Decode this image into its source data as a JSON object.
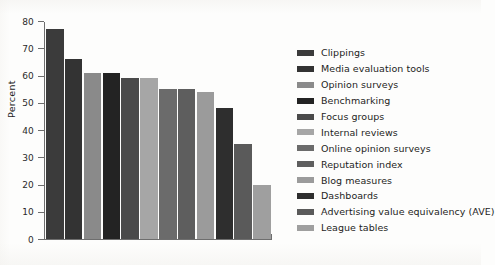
{
  "chart_data": {
    "type": "bar",
    "title": "",
    "subtitle": "",
    "xlabel": "",
    "ylabel": "Percent",
    "ylim": [
      0,
      80
    ],
    "yticks": [
      0,
      10,
      20,
      30,
      40,
      50,
      60,
      70,
      80
    ],
    "ytick_labels": [
      "0",
      "10",
      "20",
      "30",
      "40",
      "50",
      "60",
      "70",
      "80"
    ],
    "grid": false,
    "legend_position": "right",
    "categories": [
      "Clippings",
      "Media evaluation tools",
      "Opinion surveys",
      "Benchmarking",
      "Focus groups",
      "Internal reviews",
      "Online opinion surveys",
      "Reputation index",
      "Blog measures",
      "Dashboards",
      "Advertising value equivalency (AVE)",
      "League tables"
    ],
    "values": [
      77,
      66,
      61,
      61,
      59,
      59,
      55,
      55,
      54,
      48,
      35,
      20
    ],
    "colors": [
      "#3b3b3b",
      "#333333",
      "#8a8a8a",
      "#232323",
      "#4a4a4a",
      "#a6a6a6",
      "#6b6b6b",
      "#5e5e5e",
      "#9b9b9b",
      "#2e2e2e",
      "#5a5a5a",
      "#9f9f9f"
    ],
    "legend": [
      {
        "label": "Clippings",
        "color": "#3b3b3b"
      },
      {
        "label": "Media evaluation tools",
        "color": "#333333"
      },
      {
        "label": "Opinion surveys",
        "color": "#8a8a8a"
      },
      {
        "label": "Benchmarking",
        "color": "#232323"
      },
      {
        "label": "Focus groups",
        "color": "#4a4a4a"
      },
      {
        "label": "Internal reviews",
        "color": "#a6a6a6"
      },
      {
        "label": "Online opinion surveys",
        "color": "#6b6b6b"
      },
      {
        "label": "Reputation index",
        "color": "#5e5e5e"
      },
      {
        "label": "Blog measures",
        "color": "#9b9b9b"
      },
      {
        "label": "Dashboards",
        "color": "#2e2e2e"
      },
      {
        "label": "Advertising value equivalency (AVE)",
        "color": "#5a5a5a"
      },
      {
        "label": "League tables",
        "color": "#9f9f9f"
      }
    ]
  }
}
